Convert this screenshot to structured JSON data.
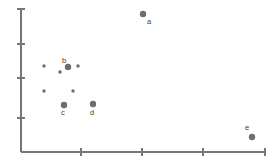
{
  "chart_data": {
    "type": "scatter",
    "title": "",
    "xlabel": "",
    "ylabel": "",
    "grid": false,
    "legend": null,
    "axes": {
      "x_ticks": [
        81,
        142,
        203,
        265
      ],
      "x_tick_labels": [],
      "y_ticks": [
        9,
        44,
        78,
        118
      ],
      "y_tick_labels": [],
      "x_origin_px": 21,
      "y_origin_px": 152,
      "xlim_px": [
        21,
        266
      ],
      "ylim_px": [
        9,
        152
      ]
    },
    "color": "#6d6d6d",
    "axis_color": "#767676",
    "label_color": "#3d3d3d",
    "labeled_points": [
      {
        "label": "a",
        "x_px": 143,
        "y_px": 14,
        "r": 3.2,
        "label_x_px": 147,
        "label_y_px": 18
      },
      {
        "label": "b",
        "x_px": 68,
        "y_px": 67,
        "r": 3.2,
        "label_x_px": 62,
        "label_y_px": 57
      },
      {
        "label": "c",
        "x_px": 64,
        "y_px": 105,
        "r": 3.2,
        "label_x_px": 61,
        "label_y_px": 109
      },
      {
        "label": "d",
        "x_px": 93,
        "y_px": 104,
        "r": 3.2,
        "label_x_px": 90,
        "label_y_px": 109
      },
      {
        "label": "e",
        "x_px": 252,
        "y_px": 137,
        "r": 3.2,
        "label_x_px": 245,
        "label_y_px": 124
      }
    ],
    "unlabeled_points": [
      {
        "x_px": 44,
        "y_px": 66,
        "r": 1.7
      },
      {
        "x_px": 78,
        "y_px": 66,
        "r": 1.7
      },
      {
        "x_px": 60,
        "y_px": 72,
        "r": 1.7
      },
      {
        "x_px": 44,
        "y_px": 91,
        "r": 1.7
      },
      {
        "x_px": 73,
        "y_px": 91,
        "r": 1.7
      }
    ]
  }
}
